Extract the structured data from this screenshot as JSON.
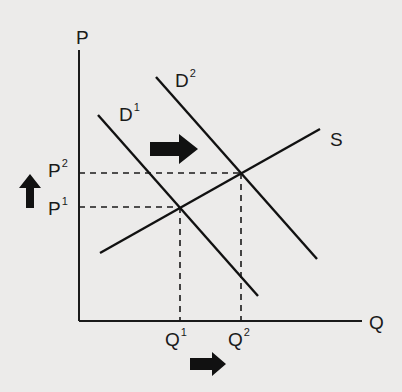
{
  "diagram": {
    "type": "supply-demand",
    "axes": {
      "y_label": "P",
      "x_label": "Q"
    },
    "curves": [
      {
        "name": "D",
        "sup": "1",
        "kind": "demand"
      },
      {
        "name": "D",
        "sup": "2",
        "kind": "demand"
      },
      {
        "name": "S",
        "sup": "",
        "kind": "supply"
      }
    ],
    "price_levels": [
      {
        "name": "P",
        "sup": "1"
      },
      {
        "name": "P",
        "sup": "2"
      }
    ],
    "quantity_levels": [
      {
        "name": "Q",
        "sup": "1"
      },
      {
        "name": "Q",
        "sup": "2"
      }
    ],
    "arrows": [
      {
        "id": "demand-shift",
        "direction": "right"
      },
      {
        "id": "price-increase",
        "direction": "up"
      },
      {
        "id": "quantity-increase",
        "direction": "right"
      }
    ],
    "colors": {
      "background": "#ecebea",
      "ink": "#1a1a1a"
    }
  }
}
